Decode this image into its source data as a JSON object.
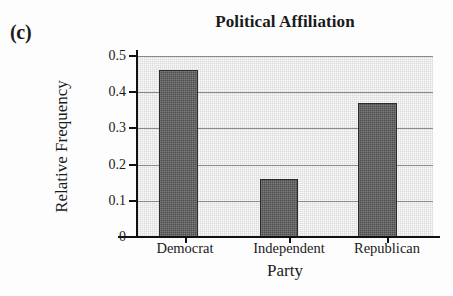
{
  "figure": {
    "panel_label": "(c)",
    "background_color": "#fdfdfd"
  },
  "chart_data": {
    "type": "bar",
    "title": "Political Affiliation",
    "xlabel": "Party",
    "ylabel": "Relative Frequency",
    "categories": [
      "Democrat",
      "Independent",
      "Republican"
    ],
    "values": [
      0.46,
      0.16,
      0.37
    ],
    "ylim": [
      0,
      0.5
    ],
    "yticks": [
      0,
      0.1,
      0.2,
      0.3,
      0.4,
      0.5
    ],
    "ytick_labels": [
      "0",
      "0.1",
      "0.2",
      "0.3",
      "0.4",
      "0.5"
    ],
    "grid": true,
    "grid_axis": "y",
    "legend": false,
    "bar_color": "#4d4d4d",
    "bar_edge_color": "#2b2b2b",
    "plot_background_color": "#d9d9d9",
    "gridline_color": "#8a8a8a",
    "axis_color": "#111111"
  }
}
